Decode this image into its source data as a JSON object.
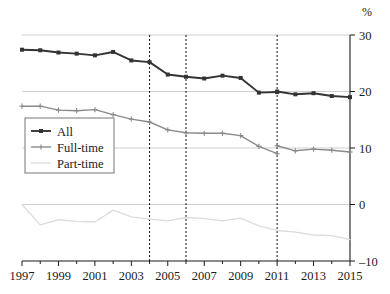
{
  "chart_data": {
    "type": "line",
    "title": "",
    "subtitle": "",
    "xlabel": "",
    "ylabel": "",
    "y_unit_label": "%",
    "x": [
      1997,
      1998,
      1999,
      2000,
      2001,
      2002,
      2003,
      2004,
      2005,
      2006,
      2007,
      2008,
      2009,
      2010,
      2011,
      2012,
      2013,
      2014,
      2015
    ],
    "xlim": [
      1997,
      2015
    ],
    "ylim": [
      -10,
      30
    ],
    "x_tick_values": [
      1997,
      1998,
      1999,
      2000,
      2001,
      2002,
      2003,
      2004,
      2005,
      2006,
      2007,
      2008,
      2009,
      2010,
      2011,
      2012,
      2013,
      2014,
      2015
    ],
    "x_tick_labels": [
      "1997",
      "",
      "1999",
      "",
      "2001",
      "",
      "2003",
      "",
      "2005",
      "",
      "2007",
      "",
      "2009",
      "",
      "2011",
      "",
      "2013",
      "",
      "2015"
    ],
    "x_labelled_ticks": [
      "1997",
      "1999",
      "2001",
      "2003",
      "2005",
      "2007",
      "2009",
      "2011",
      "2013",
      "2015"
    ],
    "y_tick_values": [
      30,
      20,
      10,
      0,
      -10
    ],
    "y_tick_labels": [
      "30",
      "20",
      "10",
      "0",
      "–10"
    ],
    "grid": {
      "horizontal": true,
      "horizontal_at": [
        30,
        20,
        10,
        0
      ],
      "vertical": false,
      "color": "#c9c9c9"
    },
    "vertical_reference_lines": [
      {
        "x": 2004,
        "style": "dashed",
        "color": "#111111"
      },
      {
        "x": 2006,
        "style": "dashed",
        "color": "#111111"
      },
      {
        "x": 2011,
        "style": "dashed",
        "color": "#111111"
      }
    ],
    "legend": {
      "position": "left-middle",
      "bordered": true,
      "entries": [
        "All",
        "Full-time",
        "Part-time"
      ]
    },
    "series": [
      {
        "name": "All",
        "color": "#333333",
        "marker": "square",
        "values": [
          27.4,
          27.3,
          26.9,
          26.7,
          26.4,
          27.0,
          25.5,
          25.2,
          23.0,
          22.6,
          22.3,
          22.8,
          22.4,
          19.8,
          19.9,
          19.5,
          19.7,
          19.2,
          19.0
        ],
        "break_at": 2011,
        "break_values": {
          "before": 19.7,
          "after": 20.0
        }
      },
      {
        "name": "Full-time",
        "color": "#8a8a8a",
        "marker": "plus",
        "values": [
          17.4,
          17.4,
          16.7,
          16.6,
          16.8,
          15.9,
          15.1,
          14.6,
          13.2,
          12.7,
          12.6,
          12.6,
          12.2,
          10.3,
          9.0,
          9.5,
          9.8,
          9.6,
          9.3
        ],
        "break_at": 2011,
        "break_values": {
          "before": 9.0,
          "after": 10.4
        }
      },
      {
        "name": "Part-time",
        "color": "#dcdcdc",
        "marker": "none",
        "values": [
          0.0,
          -3.6,
          -2.7,
          -3.0,
          -3.1,
          -1.0,
          -2.2,
          -2.6,
          -2.9,
          -2.3,
          -2.5,
          -2.9,
          -2.4,
          -3.8,
          -4.6,
          -4.9,
          -5.4,
          -5.5,
          -6.2
        ]
      }
    ]
  },
  "axes": {
    "y_unit": "%",
    "y_ticks": [
      "30",
      "20",
      "10",
      "0",
      "–10"
    ],
    "x_ticks": [
      "1997",
      "1999",
      "2001",
      "2003",
      "2005",
      "2007",
      "2009",
      "2011",
      "2013",
      "2015"
    ]
  },
  "legend": {
    "items": [
      {
        "label": "All"
      },
      {
        "label": "Full-time"
      },
      {
        "label": "Part-time"
      }
    ]
  }
}
